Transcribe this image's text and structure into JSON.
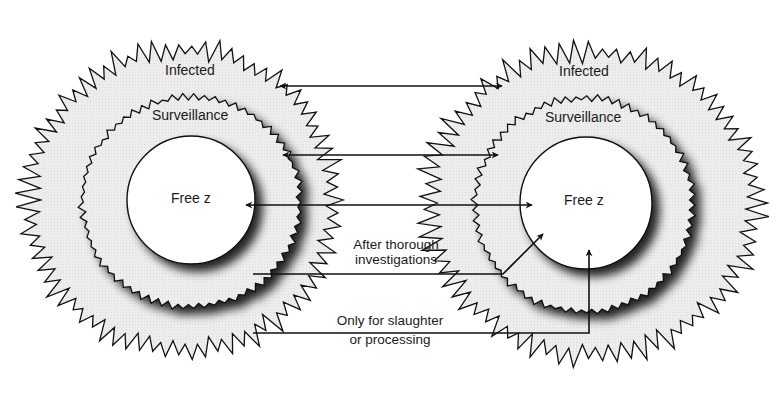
{
  "diagram": {
    "type": "zone-transfer-diagram",
    "colors": {
      "background": "#ffffff",
      "zone_fill": "#ececec",
      "free_fill": "#ffffff",
      "stroke": "#111111",
      "shadow": "#000000"
    },
    "zones_left": {
      "infected": "Infected",
      "surveillance": "Surveillance",
      "free": "Free z"
    },
    "zones_right": {
      "infected": "Infected",
      "surveillance": "Surveillance",
      "free": "Free z"
    },
    "routes": [
      {
        "from": "Infected (left)",
        "to": "Infected (right)",
        "direction": "both",
        "label": ""
      },
      {
        "from": "Surveillance (left)",
        "to": "Surveillance (right)",
        "direction": "both",
        "label": ""
      },
      {
        "from": "Free z (left)",
        "to": "Free z (right)",
        "direction": "both",
        "label": ""
      },
      {
        "from": "Surveillance (left)",
        "to": "Free z (right)",
        "direction": "one-way",
        "label_line1": "After thorough",
        "label_line2": "investigations"
      },
      {
        "from": "Infected (left)",
        "to": "Free z (right)",
        "direction": "one-way",
        "label_line1": "Only for slaughter",
        "label_line2": "or processing"
      }
    ]
  }
}
